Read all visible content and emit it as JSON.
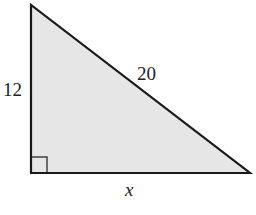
{
  "diagram": {
    "type": "right-triangle",
    "fill_color": "#e6e6e6",
    "stroke_color": "#1a1a1a",
    "labels": {
      "vertical_leg": "12",
      "hypotenuse": "20",
      "horizontal_leg": "x"
    },
    "right_angle_marker": true
  }
}
